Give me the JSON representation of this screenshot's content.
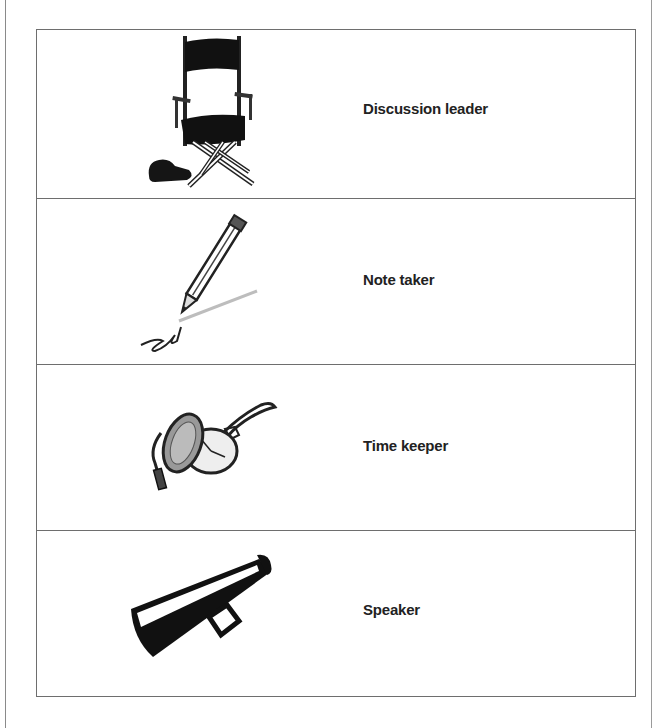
{
  "roles": [
    {
      "label": "Discussion leader",
      "icon": "directors-chair-icon"
    },
    {
      "label": "Note taker",
      "icon": "pencil-icon"
    },
    {
      "label": "Time keeper",
      "icon": "pocket-watch-icon"
    },
    {
      "label": "Speaker",
      "icon": "megaphone-icon"
    }
  ]
}
